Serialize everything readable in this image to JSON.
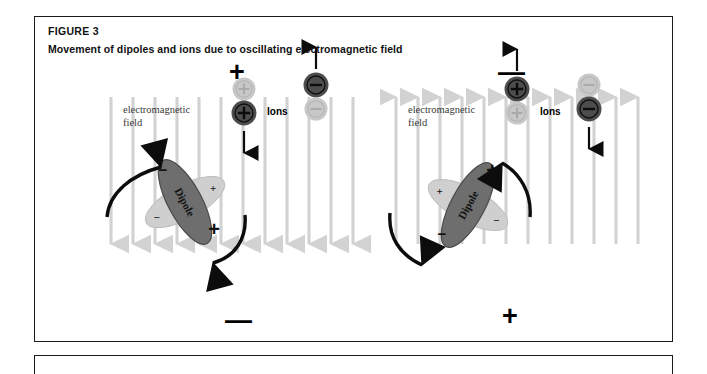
{
  "figure": {
    "label": "FIGURE 3",
    "title": "Movement of dipoles and ions due to oscillating electromagnetic field"
  },
  "colors": {
    "border": "#1b1b1b",
    "field_line": "#d2d2d2",
    "ion_dark": "#4d4d4d",
    "ion_faded": "#c8c8c8",
    "dipole_dark": "#6e6e6e",
    "dipole_light": "#cfcfcf",
    "arrow_black": "#0c0c0c",
    "text": "#111111"
  },
  "panels": [
    {
      "id": "left",
      "polarity_top": "+",
      "polarity_bottom": "—",
      "field_direction": "down",
      "field_line_count": 12,
      "emf_label": "electromagnetic\nfield",
      "emf_label_line1": "electromagnetic",
      "emf_label_line2": "field",
      "ions_label": "Ions",
      "dipole_label": "Dipole",
      "dipole_tilt_deg": 62,
      "dipole_dark_sign_top": "−",
      "dipole_dark_sign_bottom": "+",
      "dipole_light_sign_top": "+",
      "dipole_light_sign_bottom": "−",
      "ions": [
        {
          "name": "positive-ion-faded",
          "sign": "+",
          "shade": "faded",
          "position": "upper"
        },
        {
          "name": "positive-ion-dark",
          "sign": "+",
          "shade": "dark",
          "position": "lower"
        },
        {
          "name": "negative-ion-dark",
          "sign": "−",
          "shade": "dark",
          "position": "upper"
        },
        {
          "name": "negative-ion-faded",
          "sign": "−",
          "shade": "faded",
          "position": "lower"
        }
      ],
      "ion_motion": [
        {
          "name": "positive-ion-motion",
          "direction": "down"
        },
        {
          "name": "negative-ion-motion",
          "direction": "up"
        }
      ],
      "rotation_arrows": [
        {
          "name": "dipole-rotation-arrow-upper",
          "points": "up-right"
        },
        {
          "name": "dipole-rotation-arrow-lower",
          "points": "down-left"
        }
      ]
    },
    {
      "id": "right",
      "polarity_top": "—",
      "polarity_bottom": "+",
      "field_direction": "up",
      "field_line_count": 12,
      "emf_label": "electromagnetic\nfield",
      "emf_label_line1": "electromagnetic",
      "emf_label_line2": "field",
      "ions_label": "Ions",
      "dipole_label": "Dipole",
      "dipole_tilt_deg": 118,
      "dipole_dark_sign_top": "+",
      "dipole_dark_sign_bottom": "−",
      "dipole_light_sign_top": "+",
      "dipole_light_sign_bottom": "−",
      "ions": [
        {
          "name": "positive-ion-dark",
          "sign": "+",
          "shade": "dark",
          "position": "upper"
        },
        {
          "name": "positive-ion-faded",
          "sign": "+",
          "shade": "faded",
          "position": "lower"
        },
        {
          "name": "negative-ion-faded",
          "sign": "−",
          "shade": "faded",
          "position": "upper"
        },
        {
          "name": "negative-ion-dark",
          "sign": "−",
          "shade": "dark",
          "position": "lower"
        }
      ],
      "ion_motion": [
        {
          "name": "positive-ion-motion",
          "direction": "up"
        },
        {
          "name": "negative-ion-motion",
          "direction": "down"
        }
      ],
      "rotation_arrows": [
        {
          "name": "dipole-rotation-arrow-upper",
          "points": "up-left"
        },
        {
          "name": "dipole-rotation-arrow-lower",
          "points": "down-left"
        }
      ]
    }
  ]
}
